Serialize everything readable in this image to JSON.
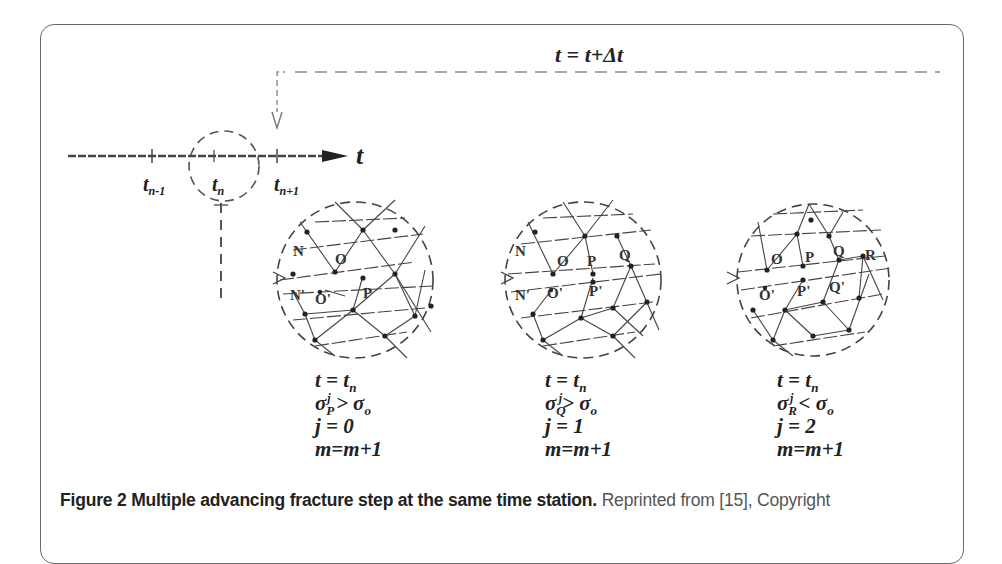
{
  "figure": {
    "time_step_label": "t = t+Δt",
    "axis": {
      "arrow_label": "t",
      "ticks": [
        {
          "base": "t",
          "sub": "n-1"
        },
        {
          "base": "t",
          "sub": "n"
        },
        {
          "base": "t",
          "sub": "n+1"
        }
      ]
    },
    "panels": [
      {
        "nodes": [
          "N",
          "O",
          "N'",
          "O'",
          "P"
        ],
        "eq_t": {
          "lhs": "t = t",
          "sub": "n"
        },
        "eq_sigma": {
          "sigma": "σ",
          "sup": "j",
          "sub": "P",
          "op": " > ",
          "rhs": "σ",
          "rhs_sub": "o"
        },
        "eq_j": "j = 0",
        "eq_m": "m=m+1"
      },
      {
        "nodes": [
          "N",
          "O",
          "P",
          "Q",
          "N'",
          "O'",
          "P'"
        ],
        "eq_t": {
          "lhs": "t = t",
          "sub": "n"
        },
        "eq_sigma": {
          "sigma": "σ",
          "sup": "j",
          "sub": "Q",
          "op": "> ",
          "rhs": "σ",
          "rhs_sub": "o"
        },
        "eq_j": "j = 1",
        "eq_m": "m=m+1"
      },
      {
        "nodes": [
          "O",
          "P",
          "Q",
          "R",
          "O'",
          "P'",
          "Q'"
        ],
        "eq_t": {
          "lhs": "t = t",
          "sub": "n"
        },
        "eq_sigma": {
          "sigma": "σ",
          "sup": "j",
          "sub": "R",
          "op": " < ",
          "rhs": "σ",
          "rhs_sub": "o"
        },
        "eq_j": "j = 2",
        "eq_m": "m=m+1"
      }
    ],
    "caption": {
      "bold": "Figure 2 Multiple advancing fracture step at the same time station.",
      "rest": " Reprinted from [15], Copyright"
    }
  }
}
